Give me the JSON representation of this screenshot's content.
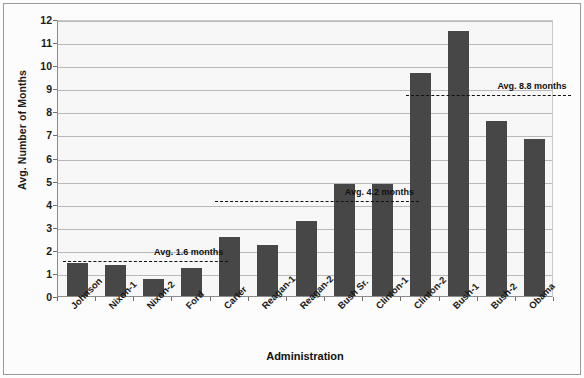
{
  "chart_data": {
    "type": "bar",
    "title": "",
    "xlabel": "Administration",
    "ylabel": "Avg. Number of Months",
    "categories": [
      "Johnson",
      "Nixon-1",
      "Nixon-2",
      "Ford",
      "Carter",
      "Reagan-1",
      "Reagan-2",
      "Bush Sr.",
      "Clinton-1",
      "Clinton-2",
      "Bush-1",
      "Bush-2",
      "Obama"
    ],
    "values": [
      1.45,
      1.35,
      0.75,
      1.2,
      2.55,
      2.2,
      3.25,
      4.85,
      4.85,
      9.65,
      11.5,
      7.6,
      6.8
    ],
    "ylim": [
      0,
      12
    ],
    "ytick_labels": [
      "12",
      "11",
      "10",
      "9",
      "8",
      "7",
      "6",
      "5",
      "4",
      "3",
      "2",
      "1",
      "0"
    ],
    "ytick_values": [
      12,
      11,
      10,
      9,
      8,
      7,
      6,
      5,
      4,
      3,
      2,
      1,
      0
    ],
    "grid": true,
    "legend": "none",
    "bar_color": "#474747",
    "plot_background": "#f7f7f7",
    "annotations": [
      {
        "label": "Avg. 1.6 months",
        "value": 1.6,
        "start_category": "Johnson",
        "end_category": "Ford",
        "label_position": "above-right"
      },
      {
        "label": "Avg. 4.2 months",
        "value": 4.2,
        "start_category": "Carter",
        "end_category": "Clinton-1",
        "label_position": "above-right"
      },
      {
        "label": "Avg. 8.8 months",
        "value": 8.8,
        "start_category": "Clinton-2",
        "end_category": "Obama",
        "label_position": "above-right"
      }
    ]
  }
}
